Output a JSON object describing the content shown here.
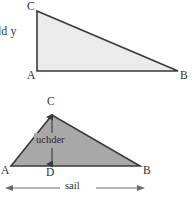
{
  "page": {
    "width": 195,
    "height": 200,
    "background": "#ffffff"
  },
  "cropped_text": {
    "text": "dd y"
  },
  "figures": [
    {
      "id": "upper-triangle",
      "kind": "right-triangle",
      "fill": "#ebebeb",
      "stroke": "#3a3a3a",
      "vertices": [
        {
          "name": "C",
          "label": "C",
          "x": 37,
          "y": 11
        },
        {
          "name": "A",
          "label": "A",
          "x": 37,
          "y": 71
        },
        {
          "name": "B",
          "label": "B",
          "x": 178,
          "y": 71
        }
      ]
    },
    {
      "id": "lower-triangle",
      "kind": "scalene-triangle",
      "fill": "#a8a8a8",
      "stroke": "#3a3a3a",
      "vertices": [
        {
          "name": "C",
          "label": "C",
          "x": 52,
          "y": 115
        },
        {
          "name": "A",
          "label": "A",
          "x": 11,
          "y": 166
        },
        {
          "name": "B",
          "label": "B",
          "x": 140,
          "y": 166
        },
        {
          "name": "D",
          "label": "D",
          "x": 52,
          "y": 166
        }
      ],
      "measures": [
        {
          "id": "height-measure",
          "label": "uchder",
          "orientation": "vertical",
          "from": {
            "x": 52,
            "y": 115
          },
          "to": {
            "x": 52,
            "y": 166
          },
          "arrowheads": "both"
        },
        {
          "id": "base-measure",
          "label": "sail",
          "orientation": "horizontal",
          "from": {
            "x": 10,
            "y": 188
          },
          "to": {
            "x": 140,
            "y": 188
          },
          "arrowheads": "both"
        }
      ]
    }
  ],
  "colors": {
    "upper_fill": "#ebebeb",
    "lower_fill": "#a8a8a8",
    "stroke": "#3a3a3a",
    "measure_line": "#6a6a6a",
    "text": "#2f2f2f"
  },
  "icons": {
    "arrow_up": "arrow-up-icon",
    "arrow_down": "arrow-down-icon",
    "arrow_left": "arrow-left-icon",
    "arrow_right": "arrow-right-icon"
  }
}
